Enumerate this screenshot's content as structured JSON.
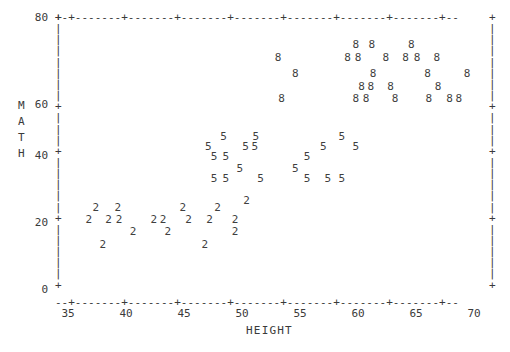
{
  "chart_data": {
    "type": "scatter",
    "title": "",
    "xlabel": "HEIGHT",
    "ylabel": "MATH",
    "xlim": [
      33,
      71.5
    ],
    "ylim": [
      0,
      80
    ],
    "xticks": [
      35,
      40,
      45,
      50,
      55,
      60,
      65,
      70
    ],
    "yticks": [
      0,
      20,
      40,
      60,
      80
    ],
    "grid": false,
    "legend": "none",
    "plot_symbol_meaning": "grade level",
    "series": [
      {
        "name": "2",
        "symbol": "2",
        "points": [
          [
            37.4,
            24.0
          ],
          [
            39.3,
            24.0
          ],
          [
            44.9,
            24.0
          ],
          [
            47.9,
            24.0
          ],
          [
            50.4,
            26.0
          ],
          [
            36.8,
            20.5
          ],
          [
            38.5,
            20.5
          ],
          [
            39.4,
            20.5
          ],
          [
            42.4,
            20.5
          ],
          [
            43.2,
            20.5
          ],
          [
            45.4,
            20.5
          ],
          [
            47.2,
            20.5
          ],
          [
            49.4,
            20.5
          ],
          [
            40.6,
            17.0
          ],
          [
            43.6,
            17.0
          ],
          [
            49.4,
            17.0
          ],
          [
            38.0,
            13.0
          ],
          [
            46.8,
            13.0
          ]
        ]
      },
      {
        "name": "5",
        "symbol": "5",
        "points": [
          [
            48.4,
            45.0
          ],
          [
            51.2,
            45.0
          ],
          [
            58.6,
            45.0
          ],
          [
            47.1,
            42.0
          ],
          [
            50.3,
            42.0
          ],
          [
            51.1,
            42.0
          ],
          [
            57.0,
            42.0
          ],
          [
            59.8,
            42.0
          ],
          [
            47.6,
            39.0
          ],
          [
            48.6,
            39.0
          ],
          [
            55.6,
            39.0
          ],
          [
            49.8,
            35.5
          ],
          [
            54.6,
            35.5
          ],
          [
            47.6,
            32.5
          ],
          [
            48.6,
            32.5
          ],
          [
            51.6,
            32.5
          ],
          [
            55.6,
            32.5
          ],
          [
            57.4,
            32.5
          ],
          [
            58.6,
            32.5
          ]
        ]
      },
      {
        "name": "8",
        "symbol": "8",
        "points": [
          [
            59.8,
            72.0
          ],
          [
            61.2,
            72.0
          ],
          [
            64.6,
            72.0
          ],
          [
            53.1,
            68.0
          ],
          [
            59.1,
            68.0
          ],
          [
            60.0,
            68.0
          ],
          [
            62.4,
            68.0
          ],
          [
            64.1,
            68.0
          ],
          [
            65.1,
            68.0
          ],
          [
            66.8,
            68.0
          ],
          [
            54.6,
            63.5
          ],
          [
            61.3,
            63.5
          ],
          [
            66.0,
            63.5
          ],
          [
            69.4,
            63.5
          ],
          [
            60.3,
            59.5
          ],
          [
            61.1,
            59.5
          ],
          [
            62.8,
            59.5
          ],
          [
            66.9,
            59.5
          ],
          [
            53.4,
            56.0
          ],
          [
            59.8,
            56.0
          ],
          [
            60.7,
            56.0
          ],
          [
            63.2,
            56.0
          ],
          [
            66.1,
            56.0
          ],
          [
            67.9,
            56.0
          ],
          [
            68.7,
            56.0
          ]
        ]
      }
    ]
  },
  "axes": {
    "y_axis": {
      "label_chars": [
        "M",
        "A",
        "T",
        "H"
      ],
      "ticks": [
        {
          "value": "80",
          "y": 17
        },
        {
          "value": "60",
          "y": 104
        },
        {
          "value": "40",
          "y": 155
        },
        {
          "value": "20",
          "y": 222
        },
        {
          "value": "0",
          "y": 289
        }
      ]
    },
    "x_axis": {
      "label": "HEIGHT",
      "ticks": [
        {
          "value": "35",
          "x": 68
        },
        {
          "value": "40",
          "x": 126
        },
        {
          "value": "45",
          "x": 184
        },
        {
          "value": "50",
          "x": 242
        },
        {
          "value": "55",
          "x": 300
        },
        {
          "value": "60",
          "x": 358
        },
        {
          "value": "65",
          "x": 416
        },
        {
          "value": "70",
          "x": 474
        }
      ]
    },
    "top_rule": "+-+-------+-------+-------+-------+-------+-------+-------+--",
    "bottom_rule": "--+-------+-------+-------+-------+-------+-------+-------+--",
    "vertical_tick": "+",
    "vertical_bar": "|"
  },
  "colors": {
    "ink": "#3a3a3a",
    "background": "#ffffff"
  }
}
